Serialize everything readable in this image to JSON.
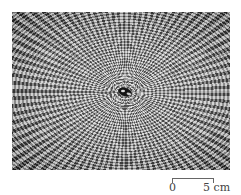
{
  "figure": {
    "scale_bar": {
      "start_label": "0",
      "end_label": "5 cm"
    },
    "colors": {
      "background": "#ffffff",
      "photo_dark": "#3a3a3a",
      "photo_light": "#b8b8b8",
      "center_mark": "#141414",
      "scale_text": "#444444"
    }
  }
}
